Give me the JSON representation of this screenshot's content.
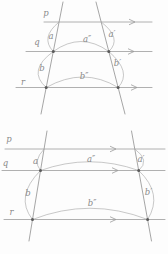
{
  "figure": {
    "background": "#fdfdfd",
    "line_color": "#9c9c9c",
    "arc_color": "#aaaaaa",
    "label_color": "#8a8a8a",
    "dot_color": "#5a5a5a"
  },
  "diagrams": [
    {
      "name": "top-transversal-diagram",
      "parallel_lines": [
        {
          "label": "p",
          "y": 22,
          "x1": 44,
          "x2": 152,
          "arrow_x": 135,
          "label_x": 46,
          "label_y": 13
        },
        {
          "label": "q",
          "y": 51.5,
          "x1": 26,
          "x2": 152,
          "arrow_x": 134,
          "label_x": 37,
          "label_y": 42.5
        },
        {
          "label": "r",
          "y": 87.5,
          "x1": 16,
          "x2": 152,
          "arrow_x": 137,
          "label_x": 23,
          "label_y": 82.5
        }
      ],
      "transversals": [
        {
          "x1": 63,
          "y1": 2,
          "x2": 41,
          "y2": 114
        },
        {
          "x1": 96,
          "y1": 2,
          "x2": 125,
          "y2": 114
        }
      ],
      "points": [
        {
          "x": 53.3,
          "y": 51.5
        },
        {
          "x": 108.8,
          "y": 51.5
        },
        {
          "x": 46.2,
          "y": 87.5
        },
        {
          "x": 118.1,
          "y": 87.5
        }
      ],
      "arcs": [
        {
          "label": "a",
          "x1": 59.1,
          "y1": 22,
          "cx": 40,
          "cy": 37.5,
          "x2": 53.3,
          "y2": 51.5,
          "label_x": 51,
          "label_y": 36
        },
        {
          "label": "a′",
          "x1": 101.2,
          "y1": 22,
          "cx": 122.5,
          "cy": 38.5,
          "x2": 108.8,
          "y2": 51.5,
          "label_x": 112,
          "label_y": 34.5
        },
        {
          "label": "a″",
          "x1": 53.3,
          "y1": 51.5,
          "cx": 81,
          "cy": 31.5,
          "x2": 108.8,
          "y2": 51.5,
          "label_x": 87,
          "label_y": 39.5
        },
        {
          "label": "b",
          "x1": 53.3,
          "y1": 51.5,
          "cx": 27,
          "cy": 70.5,
          "x2": 46.2,
          "y2": 87.5,
          "label_x": 42,
          "label_y": 68.5
        },
        {
          "label": "b′",
          "x1": 108.8,
          "y1": 51.5,
          "cx": 132.5,
          "cy": 72,
          "x2": 118.1,
          "y2": 87.5,
          "label_x": 117.5,
          "label_y": 63.5
        },
        {
          "label": "b″",
          "x1": 46.2,
          "y1": 87.5,
          "cx": 83.5,
          "cy": 66.5,
          "x2": 118.1,
          "y2": 87.5,
          "label_x": 84,
          "label_y": 76
        }
      ]
    },
    {
      "name": "bottom-transversal-diagram",
      "parallel_lines": [
        {
          "label": "p",
          "y": 149,
          "x1": 5,
          "x2": 165,
          "arrow_x": 116,
          "label_x": 9,
          "label_y": 139
        },
        {
          "label": "q",
          "y": 170.5,
          "x1": 2,
          "x2": 165,
          "arrow_x": 118,
          "label_x": 5.5,
          "label_y": 163
        },
        {
          "label": "r",
          "y": 219.5,
          "x1": 4,
          "x2": 165,
          "arrow_x": 116,
          "label_x": 11.5,
          "label_y": 212.5
        }
      ],
      "transversals": [
        {
          "x1": 47,
          "y1": 131,
          "x2": 29,
          "y2": 241
        },
        {
          "x1": 131.5,
          "y1": 131,
          "x2": 151.5,
          "y2": 241
        }
      ],
      "points": [
        {
          "x": 40.5,
          "y": 170.5
        },
        {
          "x": 138.7,
          "y": 170.5
        },
        {
          "x": 32.5,
          "y": 219.5
        },
        {
          "x": 147.6,
          "y": 219.5
        }
      ],
      "arcs": [
        {
          "label": "a",
          "x1": 44.1,
          "y1": 149,
          "cx": 32.5,
          "cy": 161,
          "x2": 40.5,
          "y2": 170.5,
          "label_x": 35.5,
          "label_y": 161
        },
        {
          "label": "a′",
          "x1": 134.8,
          "y1": 149,
          "cx": 150.5,
          "cy": 160.5,
          "x2": 138.7,
          "y2": 170.5,
          "label_x": 141,
          "label_y": 159
        },
        {
          "label": "a″",
          "x1": 40.5,
          "y1": 170.5,
          "cx": 89.5,
          "cy": 153,
          "x2": 138.7,
          "y2": 170.5,
          "label_x": 91,
          "label_y": 159.5
        },
        {
          "label": "b",
          "x1": 40.5,
          "y1": 170.5,
          "cx": 14.5,
          "cy": 196.5,
          "x2": 32.5,
          "y2": 219.5,
          "label_x": 28,
          "label_y": 193
        },
        {
          "label": "b′",
          "x1": 138.7,
          "y1": 170.5,
          "cx": 163.5,
          "cy": 194,
          "x2": 147.6,
          "y2": 219.5,
          "label_x": 148.5,
          "label_y": 192
        },
        {
          "label": "b″",
          "x1": 32.5,
          "y1": 219.5,
          "cx": 90,
          "cy": 197,
          "x2": 147.6,
          "y2": 219.5,
          "label_x": 92,
          "label_y": 203.5
        }
      ]
    }
  ]
}
